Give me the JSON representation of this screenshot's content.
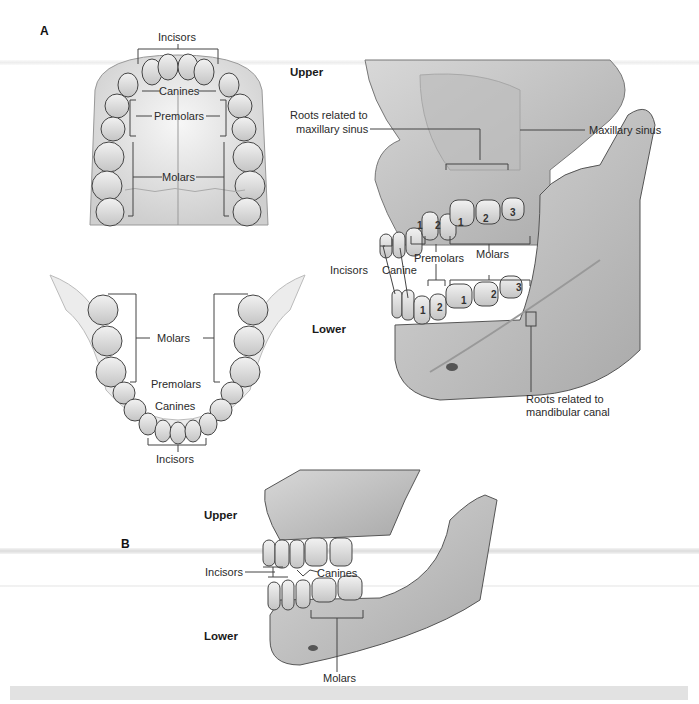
{
  "figure": {
    "panels": {
      "a": "A",
      "b": "B"
    },
    "panel_a": {
      "upper_arch_labels": {
        "incisors": "Incisors",
        "canines": "Canines",
        "premolars": "Premolars",
        "molars": "Molars"
      },
      "lower_arch_labels": {
        "molars": "Molars",
        "premolars": "Premolars",
        "canines": "Canines",
        "incisors": "Incisors"
      },
      "lateral_view": {
        "upper_label": "Upper",
        "lower_label": "Lower",
        "roots_maxillary_line1": "Roots related to",
        "roots_maxillary_line2": "maxillary sinus",
        "maxillary_sinus": "Maxillary sinus",
        "incisors": "Incisors",
        "canine": "Canine",
        "premolars": "Premolars",
        "molars": "Molars",
        "roots_mandibular_line1": "Roots related to",
        "roots_mandibular_line2": "mandibular canal",
        "upper_tooth_numbers": [
          "1",
          "2",
          "1",
          "2",
          "3"
        ],
        "lower_tooth_numbers": [
          "1",
          "2",
          "1",
          "2",
          "3"
        ]
      }
    },
    "panel_b": {
      "upper_label": "Upper",
      "lower_label": "Lower",
      "incisors": "Incisors",
      "canines": "Canines",
      "molars": "Molars"
    }
  },
  "colors": {
    "bone": "#c9c9c9",
    "bone_dark": "#8f8f8f",
    "tooth": "#e6e6e6",
    "outline": "#4a4a4a",
    "leader": "#444444"
  }
}
